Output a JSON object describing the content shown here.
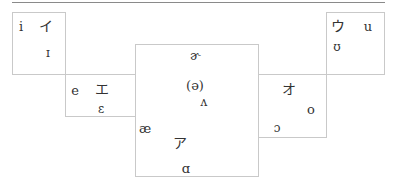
{
  "regions": [
    {
      "id": "front-high",
      "symbols": [
        {
          "id": "i",
          "text": "i",
          "type": "ipa"
        },
        {
          "id": "i-kana",
          "text": "イ",
          "type": "kana"
        },
        {
          "id": "near-i",
          "text": "ɪ",
          "type": "ipa"
        }
      ]
    },
    {
      "id": "front-mid",
      "symbols": [
        {
          "id": "e",
          "text": "e",
          "type": "ipa"
        },
        {
          "id": "e-kana",
          "text": "エ",
          "type": "kana"
        },
        {
          "id": "open-e",
          "text": "ɛ",
          "type": "ipa"
        }
      ]
    },
    {
      "id": "central",
      "symbols": [
        {
          "id": "rhotic-schwa",
          "text": "ɚ",
          "type": "ipa"
        },
        {
          "id": "schwa",
          "text": "(ə)",
          "type": "ipa"
        },
        {
          "id": "wedge",
          "text": "ʌ",
          "type": "ipa"
        },
        {
          "id": "ash",
          "text": "æ",
          "type": "ipa"
        },
        {
          "id": "a-kana",
          "text": "ア",
          "type": "kana"
        },
        {
          "id": "script-a",
          "text": "ɑ",
          "type": "ipa"
        }
      ]
    },
    {
      "id": "back-mid",
      "symbols": [
        {
          "id": "o-kana",
          "text": "オ",
          "type": "kana"
        },
        {
          "id": "o",
          "text": "o",
          "type": "ipa"
        },
        {
          "id": "open-o",
          "text": "ɔ",
          "type": "ipa"
        }
      ]
    },
    {
      "id": "back-high",
      "symbols": [
        {
          "id": "u-kana",
          "text": "ウ",
          "type": "kana"
        },
        {
          "id": "u",
          "text": "u",
          "type": "ipa"
        },
        {
          "id": "horseshoe-u",
          "text": "ʊ",
          "type": "ipa"
        }
      ]
    }
  ],
  "colors": {
    "box_border": "#c9c9c9",
    "rule": "#8a8a8a",
    "text": "#333333"
  }
}
